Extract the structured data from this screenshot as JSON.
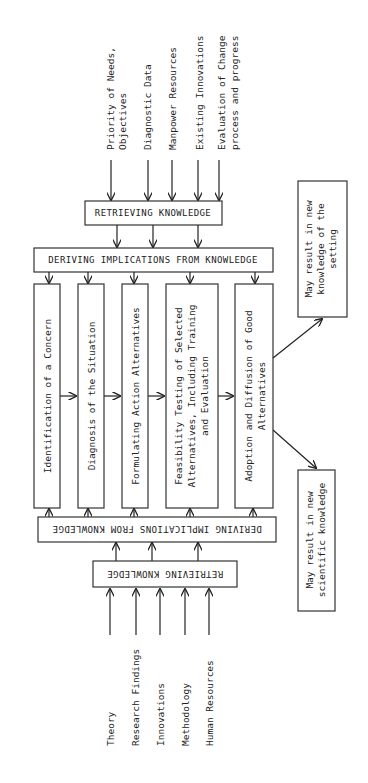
{
  "diagram": {
    "top_inputs": [
      "Priority of Needs,",
      "Objectives",
      "Diagnostic Data",
      "Manpower Resources",
      "Existing Innovations",
      "Evaluation of Change",
      "process and progress"
    ],
    "top_retrieving": "RETRIEVING KNOWLEDGE",
    "top_deriving": "DERIVING IMPLICATIONS FROM KNOWLEDGE",
    "stages": [
      [
        "Identification of a Concern"
      ],
      [
        "Diagnosis of the Situation"
      ],
      [
        "Formulating Action Alternatives"
      ],
      [
        "Feasibility Testing of Selected",
        "Alternatives, Including Training",
        "and Evaluation"
      ],
      [
        "Adoption and Diffusion of Good",
        "Alternatives"
      ]
    ],
    "bottom_deriving": "DERIVING IMPLICATIONS FROM KNOWLEDGE",
    "bottom_retrieving": "RETRIEVING KNOWLEDGE",
    "bottom_inputs": [
      "Theory",
      "Research Findings",
      "Innovations",
      "Methodology",
      "Human Resources"
    ],
    "outcome_setting": [
      "May result in new",
      "knowledge of the",
      "setting"
    ],
    "outcome_scientific": [
      "May result in new",
      "scientific knowledge"
    ]
  }
}
